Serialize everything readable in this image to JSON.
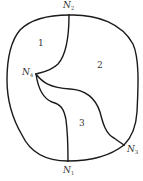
{
  "diagram": {
    "type": "planar-graph-regions",
    "nodes": [
      {
        "id": "N1",
        "letter": "N",
        "sub": "1",
        "x": 68,
        "y": 161
      },
      {
        "id": "N2",
        "letter": "N",
        "sub": "2",
        "x": 69,
        "y": 15
      },
      {
        "id": "N3",
        "letter": "N",
        "sub": "3",
        "x": 124,
        "y": 145
      },
      {
        "id": "N4",
        "letter": "N",
        "sub": "4",
        "x": 36,
        "y": 74
      }
    ],
    "regions": [
      {
        "id": "1",
        "label": "1"
      },
      {
        "id": "2",
        "label": "2"
      },
      {
        "id": "3",
        "label": "3"
      }
    ],
    "edges": [
      {
        "from": "N2",
        "to": "N4",
        "kind": "inner-curve"
      },
      {
        "from": "N4",
        "to": "N3",
        "kind": "inner-curve"
      },
      {
        "from": "N4",
        "to": "N1",
        "kind": "inner-curve"
      },
      {
        "from": "N2",
        "to": "N3",
        "kind": "outer-boundary"
      },
      {
        "from": "N3",
        "to": "N1",
        "kind": "outer-boundary"
      },
      {
        "from": "N1",
        "to": "N2",
        "kind": "outer-boundary"
      }
    ],
    "stroke_color": "#1a1a1a",
    "label_color": "#333333"
  }
}
